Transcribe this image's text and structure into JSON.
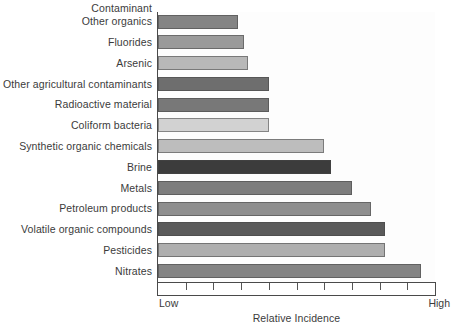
{
  "chart_data": {
    "type": "bar",
    "orientation": "horizontal",
    "title": "",
    "ylabel": "Contaminant",
    "xlabel": "Relative Incidence",
    "xlim": [
      0,
      10
    ],
    "grid": false,
    "legend": "none",
    "x_tick_labels": [
      "Low",
      "High"
    ],
    "x_tick_count": 11,
    "categories": [
      "Other organics",
      "Fluorides",
      "Arsenic",
      "Other agricultural contaminants",
      "Radioactive material",
      "Coliform bacteria",
      "Synthetic organic chemicals",
      "Brine",
      "Metals",
      "Petroleum products",
      "Volatile organic compounds",
      "Pesticides",
      "Nitrates"
    ],
    "values": [
      2.9,
      3.1,
      3.25,
      4.0,
      4.0,
      4.0,
      6.0,
      6.25,
      7.0,
      7.7,
      8.2,
      8.2,
      9.5
    ],
    "bar_colors": [
      "#848484",
      "#9a9a9a",
      "#b8b8b8",
      "#6e6e6e",
      "#787878",
      "#d2d2d2",
      "#bdbdbd",
      "#3c3c3c",
      "#7d7d7d",
      "#8e8e8e",
      "#5a5a5a",
      "#aeaeae",
      "#848484"
    ]
  },
  "axis": {
    "y_title": "Contaminant",
    "x_title": "Relative Incidence",
    "low_label": "Low",
    "high_label": "High"
  },
  "colors": {
    "axis": "#4a4a4a",
    "text": "#3b3b3b",
    "plot_background": "#fdfdfd",
    "page_background": "#ffffff"
  }
}
